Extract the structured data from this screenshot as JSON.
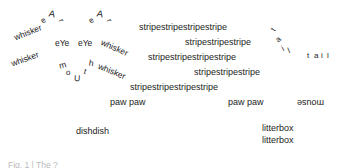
{
  "meta": {
    "width": 345,
    "height": 168,
    "background_color": "#ffffff",
    "text_color": "#1c1c1c",
    "faint_text_color": "#b9b9b9"
  },
  "ears": {
    "left": {
      "label": "eAr",
      "letters": [
        "e",
        "A",
        "r"
      ]
    },
    "right": {
      "label": "eAr",
      "letters": [
        "e",
        "A",
        "r"
      ]
    }
  },
  "eyes": {
    "left_label": "eYe",
    "right_label": "eYe"
  },
  "mouth": {
    "label": "moUth",
    "letters": [
      "m",
      "o",
      "U",
      "t",
      "h"
    ]
  },
  "whiskers": {
    "left": [
      "whisker",
      "whisker"
    ],
    "right": [
      "whisker",
      "whisker"
    ]
  },
  "stripes": {
    "rows": [
      "stripestripestripestripe",
      "stripestripestripe",
      "stripestripestripestripe",
      "stripestripestripe",
      "stripestripestripestripe"
    ]
  },
  "tail": {
    "curved_label": "tail",
    "curved_letters": [
      "t",
      "a",
      "i",
      "l"
    ],
    "straight_label": "tail",
    "straight_letters": [
      "t",
      "a",
      "i",
      "l"
    ]
  },
  "paws": {
    "front": "paw paw",
    "back": "paw paw"
  },
  "mouse": {
    "label": "mouse",
    "orientation": "flipped"
  },
  "dish": {
    "label": "dishdish"
  },
  "litterbox": {
    "line1": "litterbox",
    "line2": "litterbox"
  },
  "caption": {
    "text": "Fig. 1 | The ?"
  }
}
